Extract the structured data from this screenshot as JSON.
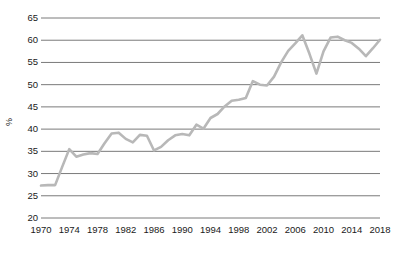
{
  "chart_data": {
    "type": "line",
    "title": "",
    "xlabel": "",
    "ylabel": "%",
    "ylim": [
      20,
      65
    ],
    "xlim": [
      1970,
      2018
    ],
    "grid": true,
    "legend": "none",
    "yticks": [
      20,
      25,
      30,
      35,
      40,
      45,
      50,
      55,
      60,
      65
    ],
    "xticks": [
      1970,
      1974,
      1978,
      1982,
      1986,
      1990,
      1994,
      1998,
      2002,
      2006,
      2010,
      2014,
      2018
    ],
    "line_color": "#b8b8b8",
    "grid_color": "#7a7a7a",
    "text_color": "#1a1a1a",
    "x": [
      1970,
      1971,
      1972,
      1973,
      1974,
      1975,
      1976,
      1977,
      1978,
      1979,
      1980,
      1981,
      1982,
      1983,
      1984,
      1985,
      1986,
      1987,
      1988,
      1989,
      1990,
      1991,
      1992,
      1993,
      1994,
      1995,
      1996,
      1997,
      1998,
      1999,
      2000,
      2001,
      2002,
      2003,
      2004,
      2005,
      2006,
      2007,
      2008,
      2009,
      2010,
      2011,
      2012,
      2013,
      2014,
      2015,
      2016,
      2017,
      2018
    ],
    "series": [
      {
        "name": "%",
        "values": [
          27.3,
          27.4,
          27.4,
          31.5,
          35.5,
          33.8,
          34.3,
          34.6,
          34.4,
          36.8,
          39.0,
          39.2,
          37.8,
          37.0,
          38.7,
          38.5,
          35.2,
          36.0,
          37.5,
          38.6,
          38.9,
          38.6,
          41.0,
          40.1,
          42.5,
          43.4,
          45.1,
          46.4,
          46.6,
          47.0,
          50.8,
          50.0,
          49.8,
          51.8,
          55.0,
          57.6,
          59.3,
          61.1,
          57.0,
          52.5,
          57.5,
          60.6,
          60.8,
          60.0,
          59.4,
          58.1,
          56.4,
          58.2,
          60.1
        ]
      }
    ]
  }
}
